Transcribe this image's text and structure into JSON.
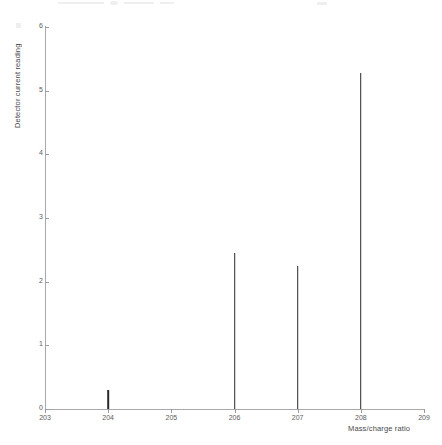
{
  "chart_data": {
    "type": "bar",
    "title": "",
    "subtitle": "",
    "xlabel": "Mass/charge ratio",
    "ylabel": "Detector current reading",
    "xlim": [
      203,
      209
    ],
    "ylim": [
      0,
      6
    ],
    "grid": false,
    "legend": null,
    "x_ticks": [
      "203",
      "204",
      "205",
      "206",
      "207",
      "208",
      "209"
    ],
    "y_ticks": [
      "0",
      "1",
      "2",
      "3",
      "4",
      "5",
      "6"
    ],
    "categories": [
      204,
      206,
      207,
      208
    ],
    "values": [
      0.3,
      2.45,
      2.25,
      5.28
    ],
    "series": [
      {
        "name": "Detector current reading",
        "points": [
          {
            "x": 204,
            "y": 0.3
          },
          {
            "x": 206,
            "y": 2.45
          },
          {
            "x": 207,
            "y": 2.25
          },
          {
            "x": 208,
            "y": 5.28
          }
        ]
      }
    ],
    "colors": {
      "peak": "#2a2a2c",
      "axis": "#a9a9ad",
      "tick_label": "#5c5c60",
      "axis_title": "#48484c",
      "background": "#ffffff"
    }
  }
}
